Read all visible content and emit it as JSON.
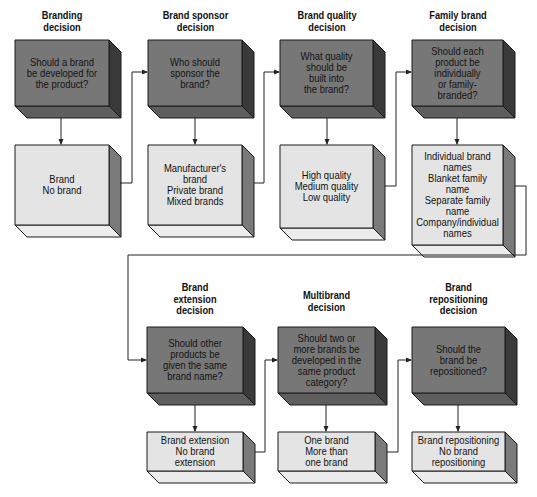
{
  "colors": {
    "decision_front": "#777777",
    "decision_side": "#3a3a3a",
    "decision_bottom": "#5e5e5e",
    "option_front": "#e4e4e4",
    "option_side": "#7a7a7a",
    "option_bottom": "#ececec",
    "line": "#222222"
  },
  "row1": [
    {
      "heading": "Branding\ndecision",
      "question": "Should a brand\nbe developed for\nthe product?",
      "options": "Brand\nNo brand"
    },
    {
      "heading": "Brand sponsor\ndecision",
      "question": "Who should\nsponsor the\nbrand?",
      "options": "Manufacturer's\nbrand\nPrivate brand\nMixed brands"
    },
    {
      "heading": "Brand quality\ndecision",
      "question": "What quality\nshould be\nbuilt into\nthe brand?",
      "options": "High quality\nMedium quality\nLow quality"
    },
    {
      "heading": "Family brand\ndecision",
      "question": "Should each\nproduct be\nindividually\nor family-\nbranded?",
      "options": "Individual brand\nnames\nBlanket family\nname\nSeparate family\nname\nCompany/individual\nnames"
    }
  ],
  "row2": [
    {
      "heading": "Brand\nextension\ndecision",
      "question": "Should other\nproducts be\ngiven the same\nbrand name?",
      "options": "Brand extension\nNo brand\nextension"
    },
    {
      "heading": "Multibrand\ndecision",
      "question": "Should two or\nmore brands be\ndeveloped in the\nsame product\ncategory?",
      "options": "One brand\nMore than\none brand"
    },
    {
      "heading": "Brand\nrepositioning\ndecision",
      "question": "Should the\nbrand be\nrepositioned?",
      "options": "Brand repositioning\nNo brand\nrepositioning"
    }
  ]
}
